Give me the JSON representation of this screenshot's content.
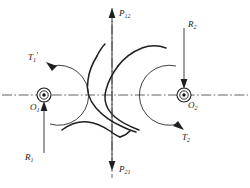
{
  "diagram": {
    "background_color": "#ffffff",
    "line_color": "#2a2a2a",
    "curve_color": "#1f1f1f",
    "width": 250,
    "height": 188
  },
  "labels": {
    "force_top": {
      "base": "P",
      "sub": "12",
      "full": "P12"
    },
    "force_bottom": {
      "base": "P",
      "sub": "21",
      "full": "P21"
    },
    "reaction_left": {
      "base": "R",
      "sub": "1",
      "full": "R1"
    },
    "reaction_right": {
      "base": "R",
      "sub": "2",
      "full": "R2"
    },
    "torque_left": {
      "base": "T",
      "sub": "1",
      "prime": "′",
      "full": "T1′"
    },
    "torque_right": {
      "base": "T",
      "sub": "2",
      "prime": "",
      "full": "T2"
    },
    "center_left": {
      "base": "O",
      "sub": "1",
      "full": "O1"
    },
    "center_right": {
      "base": "O",
      "sub": "2",
      "full": "O2"
    }
  },
  "geometry": {
    "left_center": {
      "x": 44,
      "y": 95
    },
    "right_center": {
      "x": 184,
      "y": 95
    },
    "vertical_axis_x": 112,
    "horizontal_axis_y": 95
  },
  "icons": {
    "bearing_left": "shaft-axis-out-of-page-icon",
    "bearing_right": "shaft-axis-out-of-page-icon",
    "arrow_up": "arrow-up-icon",
    "arrow_down": "arrow-down-icon",
    "torque_ccw": "torque-arc-counterclockwise-icon",
    "torque_cw": "torque-arc-clockwise-icon"
  }
}
